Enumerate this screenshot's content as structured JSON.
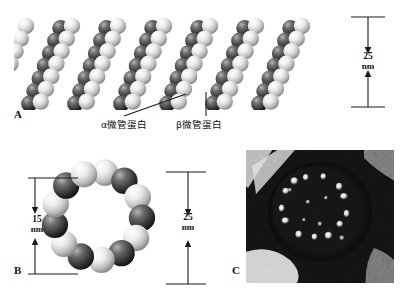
{
  "figure": {
    "background_color": "#ffffff",
    "ink_color": "#1a1a1a"
  },
  "panels": [
    {
      "id": "A",
      "label": "A",
      "type": "space-filling-model",
      "description": "Three-dimensional space-filling model of a microtubule wall built from alternating light and dark tubulin subunits arranged in helical protofilaments",
      "protofilament_columns": 13,
      "subunit_rows": 7,
      "callouts": [
        {
          "name": "alpha-tubulin",
          "text": "α微管蛋白",
          "leader": "diagonal"
        },
        {
          "name": "beta-tubulin",
          "text": "β微管蛋白",
          "leader": "vertical"
        }
      ],
      "scale": {
        "value": "25",
        "unit": "nm",
        "orientation": "vertical",
        "arrows": "double-headed"
      }
    },
    {
      "id": "B",
      "label": "B",
      "type": "cross-section-ring",
      "description": "Cross-sectional view of a microtubule showing a ring of 13 tubulin subunits alternating light and dark",
      "subunit_count": 13,
      "scales": [
        {
          "name": "inner-diameter",
          "value": "15",
          "unit": "nm",
          "side": "left"
        },
        {
          "name": "outer-diameter",
          "value": "25",
          "unit": "nm",
          "side": "right"
        }
      ]
    },
    {
      "id": "C",
      "label": "C",
      "type": "electron-micrograph",
      "description": "Transmission electron micrograph of a microtubule in cross-section showing a ring of bright protofilament densities on a dark grainy background",
      "bright_spot_count": 13
    }
  ],
  "colors": {
    "subunit_light": "#f2f2f0",
    "subunit_light_shadow": "#9a9a97",
    "subunit_dark": "#4a4a4a",
    "subunit_dark_shadow": "#1d1d1d",
    "em_background": "#0d0d0d",
    "em_highlight": "#e8e8e8",
    "ink": "#1a1a1a"
  }
}
